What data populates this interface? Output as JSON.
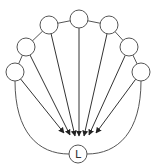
{
  "diagram": {
    "type": "fan-in network",
    "colors": {
      "stroke": "#555555",
      "arrow": "#333333",
      "fill": "#ffffff"
    },
    "target": {
      "id": "L",
      "label": "L",
      "cx": 78,
      "cy": 154,
      "r": 9
    },
    "sources": [
      {
        "id": "n1",
        "cx": 15,
        "cy": 72,
        "r": 9,
        "arrow_end": [
          64,
          133
        ]
      },
      {
        "id": "n2",
        "cx": 26,
        "cy": 47,
        "r": 9,
        "arrow_end": [
          70,
          135
        ]
      },
      {
        "id": "n3",
        "cx": 49,
        "cy": 25,
        "r": 9,
        "arrow_end": [
          75,
          136
        ]
      },
      {
        "id": "n4",
        "cx": 79,
        "cy": 19,
        "r": 9,
        "arrow_end": [
          79,
          136
        ]
      },
      {
        "id": "n5",
        "cx": 109,
        "cy": 25,
        "r": 9,
        "arrow_end": [
          84,
          136
        ]
      },
      {
        "id": "n6",
        "cx": 129,
        "cy": 47,
        "r": 9,
        "arrow_end": [
          89,
          135
        ]
      },
      {
        "id": "n7",
        "cx": 141,
        "cy": 72,
        "r": 9,
        "arrow_end": [
          96,
          133
        ]
      }
    ]
  }
}
